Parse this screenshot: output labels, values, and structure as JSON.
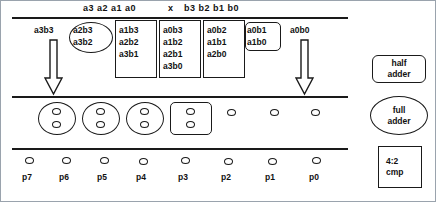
{
  "diagram": {
    "operand_header": {
      "multiplicand": "a3 a2 a1 a0",
      "operator": "x",
      "multiplier": "b3 b2 b1 b0"
    },
    "partial_product_columns": [
      {
        "weight": 6,
        "terms": [
          "a3b3"
        ],
        "group": "none"
      },
      {
        "weight": 5,
        "terms": [
          "a2b3",
          "a3b2"
        ],
        "group": "ellipse"
      },
      {
        "weight": 4,
        "terms": [
          "a1b3",
          "a2b2",
          "a3b1"
        ],
        "group": "rect"
      },
      {
        "weight": 3,
        "terms": [
          "a0b3",
          "a1b2",
          "a2b1",
          "a3b0"
        ],
        "group": "rect"
      },
      {
        "weight": 2,
        "terms": [
          "a0b2",
          "a1b1",
          "a2b0"
        ],
        "group": "rect"
      },
      {
        "weight": 1,
        "terms": [
          "a0b1",
          "a1b0"
        ],
        "group": "round"
      },
      {
        "weight": 0,
        "terms": [
          "a0b0"
        ],
        "group": "none"
      }
    ],
    "stage2_columns": [
      {
        "dots": 2,
        "group": "ellipse"
      },
      {
        "dots": 2,
        "group": "ellipse"
      },
      {
        "dots": 2,
        "group": "ellipse"
      },
      {
        "dots": 2,
        "group": "round"
      },
      {
        "dots": 1,
        "group": "none"
      },
      {
        "dots": 1,
        "group": "none"
      },
      {
        "dots": 1,
        "group": "none"
      }
    ],
    "product_bits": [
      "p7",
      "p6",
      "p5",
      "p4",
      "p3",
      "p2",
      "p1",
      "p0"
    ],
    "arrows": [
      {
        "name": "left-passthrough-arrow"
      },
      {
        "name": "right-passthrough-arrow"
      }
    ],
    "legend": [
      {
        "shape": "round-rect",
        "line1": "half",
        "line2": "adder"
      },
      {
        "shape": "ellipse",
        "line1": "full",
        "line2": "adder"
      },
      {
        "shape": "square",
        "line1": "4:2",
        "line2": "cmp"
      }
    ],
    "colors": {
      "ink": "#1a1a1a",
      "background": "#ffffff",
      "frame": "#9aa3ad"
    }
  }
}
